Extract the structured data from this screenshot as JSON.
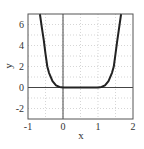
{
  "chart_data": {
    "type": "line",
    "title": "",
    "xlabel": "x",
    "ylabel": "y",
    "xlim": [
      -1,
      2
    ],
    "ylim": [
      -3,
      7
    ],
    "grid": true,
    "legend": null,
    "x_ticks": [
      -1,
      0,
      1,
      2
    ],
    "x_tick_labels": [
      "-1",
      "0",
      "1",
      "2"
    ],
    "y_ticks": [
      -2,
      0,
      2,
      4,
      6
    ],
    "y_tick_labels": [
      "-2",
      "0",
      "2",
      "4",
      "6"
    ],
    "series": [
      {
        "name": "curve",
        "color": "#222222",
        "x": [
          -0.66,
          -0.6,
          -0.55,
          -0.5,
          -0.45,
          -0.4,
          -0.3,
          -0.2,
          -0.1,
          0.0,
          0.5,
          1.0,
          1.1,
          1.2,
          1.3,
          1.4,
          1.45,
          1.5,
          1.55,
          1.6,
          1.66
        ],
        "y": [
          7.0,
          5.6,
          4.5,
          3.2,
          2.0,
          1.4,
          0.6,
          0.2,
          0.05,
          0.0,
          0.0,
          0.0,
          0.05,
          0.2,
          0.6,
          1.4,
          2.0,
          3.2,
          4.5,
          5.6,
          7.0
        ]
      }
    ]
  },
  "colors": {
    "curve": "#222222",
    "axes_frame": "#555555",
    "zero_lines": "#444444",
    "grid": "#bbbbbb",
    "background": "#ffffff"
  }
}
